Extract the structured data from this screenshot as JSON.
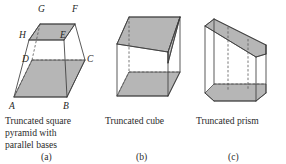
{
  "figure": {
    "width": 286,
    "height": 164,
    "background_color": "#ffffff",
    "face_fill_color": "#a9a9a9",
    "edge_color": "#3c3c3c",
    "hidden_edge_color": "#555555",
    "label_color": "#252525"
  },
  "panels": [
    {
      "id": "a",
      "caption_lines": [
        "Truncated square",
        "pyramid with",
        "parallel bases"
      ],
      "subcaption": "(a)",
      "vertex_labels": [
        "A",
        "B",
        "C",
        "D",
        "E",
        "F",
        "G",
        "H"
      ],
      "labels": {
        "A": "A",
        "B": "B",
        "C": "C",
        "D": "D",
        "E": "E",
        "F": "F",
        "G": "G",
        "H": "H"
      }
    },
    {
      "id": "b",
      "caption_lines": [
        "Truncated cube"
      ],
      "subcaption": "(b)",
      "vertex_labels": [],
      "labels": {}
    },
    {
      "id": "c",
      "caption_lines": [
        "Truncated prism"
      ],
      "subcaption": "(c)",
      "vertex_labels": [],
      "labels": {}
    }
  ]
}
